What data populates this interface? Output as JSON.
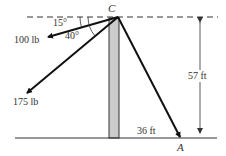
{
  "diagram": {
    "point_top": "C",
    "point_ground": "A",
    "forces": [
      {
        "label": "100 lb",
        "angle_deg": 15
      },
      {
        "label": "175 lb",
        "angle_deg": 40
      }
    ],
    "angles": {
      "a1": "15°",
      "a2": "40°"
    },
    "dimensions": {
      "height": "57 ft",
      "horizontal": "36 ft"
    },
    "colors": {
      "line": "#111111",
      "pole": "#cccccc",
      "text": "#333333"
    }
  }
}
